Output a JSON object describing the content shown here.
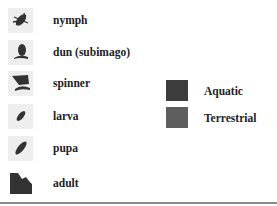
{
  "life_stages": [
    {
      "label": "nymph",
      "icon": "nymph-icon"
    },
    {
      "label": "dun (subimago)",
      "icon": "dun-icon"
    },
    {
      "label": "spinner",
      "icon": "spinner-icon"
    },
    {
      "label": "larva",
      "icon": "larva-icon"
    },
    {
      "label": "pupa",
      "icon": "pupa-icon"
    },
    {
      "label": "adult",
      "icon": "adult-icon"
    }
  ],
  "habitats": [
    {
      "label": "Aquatic",
      "color": "#3c3c3c"
    },
    {
      "label": "Terrestrial",
      "color": "#5e5e5e"
    }
  ]
}
